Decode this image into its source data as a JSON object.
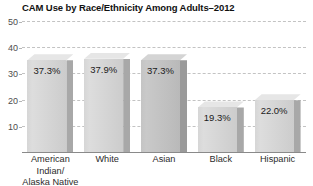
{
  "chart_data": {
    "type": "bar",
    "title": "CAM Use by Race/Ethnicity Among Adults–2012",
    "xlabel": "",
    "ylabel": "",
    "ylim": [
      0,
      50
    ],
    "yticks": [
      10,
      20,
      30,
      40,
      50
    ],
    "grid": true,
    "legend": false,
    "categories": [
      "American Indian/\nAlaska Native",
      "White",
      "Asian",
      "Black",
      "Hispanic"
    ],
    "values": [
      37.3,
      37.9,
      37.3,
      19.3,
      22.0
    ],
    "value_labels": [
      "37.3%",
      "37.9%",
      "37.3%",
      "19.3%",
      "22.0%"
    ],
    "bar_style": "3d-shaded-gray",
    "bar_colors": [
      "#d6d6d6",
      "#dddddd",
      "#c4c4c4",
      "#dddddd",
      "#d6d6d6"
    ],
    "axis_color": "#8a8a8a",
    "gridline_color": "#c3c3c3",
    "title_color": "#111111"
  }
}
